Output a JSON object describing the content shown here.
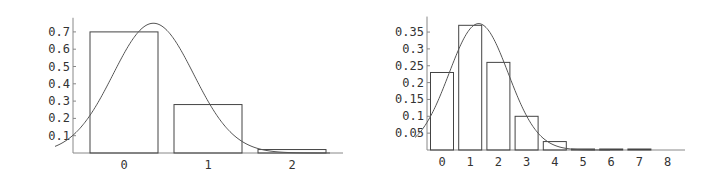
{
  "chart_data": [
    {
      "type": "bar",
      "title": "",
      "xlabel": "",
      "ylabel": "",
      "categories": [
        "0",
        "1",
        "2"
      ],
      "values": [
        0.7,
        0.28,
        0.02
      ],
      "overlay_curve": {
        "type": "line",
        "description": "normal density curve",
        "peak_x": 0.35,
        "peak_y": 0.75
      },
      "yticks": [
        "0.1",
        "0.2",
        "0.3",
        "0.4",
        "0.5",
        "0.6",
        "0.7"
      ],
      "xticks": [
        "0",
        "1",
        "2"
      ],
      "ylim": [
        0,
        0.77
      ],
      "grid": false
    },
    {
      "type": "bar",
      "title": "",
      "xlabel": "",
      "ylabel": "",
      "categories": [
        "0",
        "1",
        "2",
        "3",
        "4",
        "5",
        "6",
        "7",
        "8"
      ],
      "values": [
        0.23,
        0.37,
        0.26,
        0.1,
        0.025,
        0.003,
        0.0005,
        0.0001,
        0.0
      ],
      "overlay_curve": {
        "type": "line",
        "description": "normal density curve",
        "peak_x": 1.3,
        "peak_y": 0.375
      },
      "yticks": [
        "0.05",
        "0.1",
        "0.15",
        "0.2",
        "0.25",
        "0.3",
        "0.35"
      ],
      "xticks": [
        "0",
        "1",
        "2",
        "3",
        "4",
        "5",
        "6",
        "7",
        "8"
      ],
      "ylim": [
        0,
        0.39
      ],
      "grid": false
    }
  ]
}
